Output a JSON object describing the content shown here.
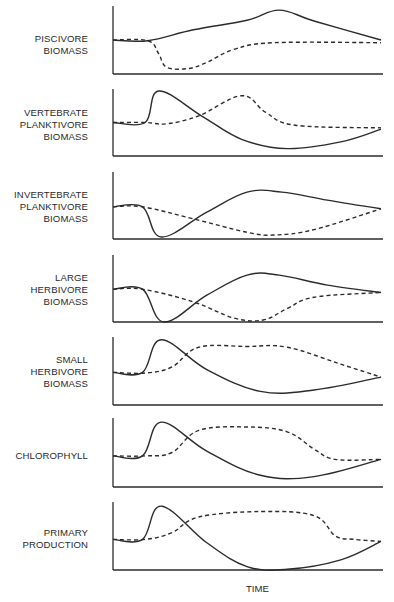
{
  "chart_data": {
    "type": "line",
    "title": "",
    "xlabel": "TIME",
    "ylabel": "",
    "grid": false,
    "legend": null,
    "note": "Schematic stacked panels; solid and dashed lines represent two alternative scenarios. No numeric tick labels. Coordinates below are normalized: x in [0,1] across time axis, y in [0,1] of panel height (0 = x-axis baseline, 1 = top of y-axis).",
    "panels": [
      {
        "label": "PISCIVORE\nBIOMASS",
        "series": [
          {
            "name": "solid",
            "style": "solid",
            "points": [
              [
                0,
                0.5
              ],
              [
                0.13,
                0.49
              ],
              [
                0.3,
                0.65
              ],
              [
                0.5,
                0.79
              ],
              [
                0.62,
                0.94
              ],
              [
                0.75,
                0.78
              ],
              [
                1.0,
                0.5
              ]
            ]
          },
          {
            "name": "dashed",
            "style": "dashed",
            "points": [
              [
                0,
                0.5
              ],
              [
                0.13,
                0.49
              ],
              [
                0.17,
                0.3
              ],
              [
                0.2,
                0.1
              ],
              [
                0.28,
                0.08
              ],
              [
                0.35,
                0.17
              ],
              [
                0.45,
                0.36
              ],
              [
                0.6,
                0.46
              ],
              [
                1.0,
                0.46
              ]
            ]
          }
        ]
      },
      {
        "label": "VERTEBRATE\nPLANKTIVORE\nBIOMASS",
        "series": [
          {
            "name": "solid",
            "style": "solid",
            "points": [
              [
                0,
                0.5
              ],
              [
                0.12,
                0.5
              ],
              [
                0.17,
                0.97
              ],
              [
                0.33,
                0.6
              ],
              [
                0.48,
                0.25
              ],
              [
                0.65,
                0.11
              ],
              [
                0.85,
                0.21
              ],
              [
                1.0,
                0.4
              ]
            ]
          },
          {
            "name": "dashed",
            "style": "dashed",
            "points": [
              [
                0,
                0.5
              ],
              [
                0.12,
                0.5
              ],
              [
                0.2,
                0.48
              ],
              [
                0.32,
                0.6
              ],
              [
                0.48,
                0.9
              ],
              [
                0.57,
                0.65
              ],
              [
                0.68,
                0.46
              ],
              [
                1.0,
                0.42
              ]
            ]
          }
        ]
      },
      {
        "label": "INVERTEBRATE\nPLANKTIVORE\nBIOMASS",
        "series": [
          {
            "name": "solid",
            "style": "solid",
            "points": [
              [
                0,
                0.48
              ],
              [
                0.11,
                0.48
              ],
              [
                0.18,
                0.03
              ],
              [
                0.35,
                0.4
              ],
              [
                0.5,
                0.7
              ],
              [
                0.63,
                0.7
              ],
              [
                0.8,
                0.58
              ],
              [
                1.0,
                0.45
              ]
            ]
          },
          {
            "name": "dashed",
            "style": "dashed",
            "points": [
              [
                0,
                0.48
              ],
              [
                0.11,
                0.48
              ],
              [
                0.3,
                0.3
              ],
              [
                0.5,
                0.1
              ],
              [
                0.6,
                0.06
              ],
              [
                0.75,
                0.14
              ],
              [
                1.0,
                0.45
              ]
            ]
          }
        ]
      },
      {
        "label": "LARGE\nHERBIVORE\nBIOMASS",
        "series": [
          {
            "name": "solid",
            "style": "solid",
            "points": [
              [
                0,
                0.49
              ],
              [
                0.11,
                0.49
              ],
              [
                0.19,
                0.0
              ],
              [
                0.35,
                0.4
              ],
              [
                0.5,
                0.7
              ],
              [
                0.62,
                0.7
              ],
              [
                0.8,
                0.55
              ],
              [
                1.0,
                0.44
              ]
            ]
          },
          {
            "name": "dashed",
            "style": "dashed",
            "points": [
              [
                0,
                0.49
              ],
              [
                0.11,
                0.49
              ],
              [
                0.3,
                0.3
              ],
              [
                0.45,
                0.06
              ],
              [
                0.56,
                0.03
              ],
              [
                0.65,
                0.2
              ],
              [
                0.75,
                0.37
              ],
              [
                1.0,
                0.44
              ]
            ]
          }
        ]
      },
      {
        "label": "SMALL\nHERBIVORE\nBIOMASS",
        "series": [
          {
            "name": "solid",
            "style": "solid",
            "points": [
              [
                0,
                0.48
              ],
              [
                0.11,
                0.48
              ],
              [
                0.18,
                0.96
              ],
              [
                0.35,
                0.52
              ],
              [
                0.55,
                0.2
              ],
              [
                0.75,
                0.22
              ],
              [
                1.0,
                0.41
              ]
            ]
          },
          {
            "name": "dashed",
            "style": "dashed",
            "points": [
              [
                0,
                0.48
              ],
              [
                0.12,
                0.47
              ],
              [
                0.22,
                0.56
              ],
              [
                0.32,
                0.85
              ],
              [
                0.5,
                0.86
              ],
              [
                0.65,
                0.85
              ],
              [
                0.85,
                0.6
              ],
              [
                1.0,
                0.41
              ]
            ]
          }
        ]
      },
      {
        "label": "CHLOROPHYLL",
        "series": [
          {
            "name": "solid",
            "style": "solid",
            "points": [
              [
                0,
                0.45
              ],
              [
                0.11,
                0.45
              ],
              [
                0.18,
                0.94
              ],
              [
                0.35,
                0.52
              ],
              [
                0.55,
                0.17
              ],
              [
                0.75,
                0.15
              ],
              [
                1.0,
                0.4
              ]
            ]
          },
          {
            "name": "dashed",
            "style": "dashed",
            "points": [
              [
                0,
                0.45
              ],
              [
                0.12,
                0.45
              ],
              [
                0.22,
                0.5
              ],
              [
                0.32,
                0.82
              ],
              [
                0.5,
                0.87
              ],
              [
                0.65,
                0.8
              ],
              [
                0.75,
                0.55
              ],
              [
                0.83,
                0.4
              ],
              [
                1.0,
                0.4
              ]
            ]
          }
        ]
      },
      {
        "label": "PRIMARY\nPRODUCTION",
        "series": [
          {
            "name": "solid",
            "style": "solid",
            "points": [
              [
                0,
                0.45
              ],
              [
                0.11,
                0.45
              ],
              [
                0.18,
                0.94
              ],
              [
                0.35,
                0.4
              ],
              [
                0.5,
                0.05
              ],
              [
                0.65,
                0.01
              ],
              [
                0.85,
                0.15
              ],
              [
                1.0,
                0.42
              ]
            ]
          },
          {
            "name": "dashed",
            "style": "dashed",
            "points": [
              [
                0,
                0.45
              ],
              [
                0.12,
                0.45
              ],
              [
                0.22,
                0.55
              ],
              [
                0.32,
                0.78
              ],
              [
                0.55,
                0.86
              ],
              [
                0.75,
                0.8
              ],
              [
                0.83,
                0.5
              ],
              [
                0.9,
                0.45
              ],
              [
                1.0,
                0.42
              ]
            ]
          }
        ]
      }
    ]
  },
  "layout": {
    "axis_left_x": 113,
    "axis_right_x": 383,
    "curve_end_x": 381,
    "panels_px": [
      {
        "top": 6,
        "base": 74
      },
      {
        "top": 89,
        "base": 156
      },
      {
        "top": 172,
        "base": 239
      },
      {
        "top": 255,
        "base": 322
      },
      {
        "top": 337,
        "base": 405
      },
      {
        "top": 418,
        "base": 487
      },
      {
        "top": 502,
        "base": 570
      }
    ],
    "line_color": "#2b2b2b"
  },
  "labels": {
    "panel_0": "PISCIVORE\nBIOMASS",
    "panel_1": "VERTEBRATE\nPLANKTIVORE\nBIOMASS",
    "panel_2": "INVERTEBRATE\nPLANKTIVORE\nBIOMASS",
    "panel_3": "LARGE\nHERBIVORE\nBIOMASS",
    "panel_4": "SMALL\nHERBIVORE\nBIOMASS",
    "panel_5": "CHLOROPHYLL",
    "panel_6": "PRIMARY\nPRODUCTION",
    "x_title": "TIME"
  }
}
